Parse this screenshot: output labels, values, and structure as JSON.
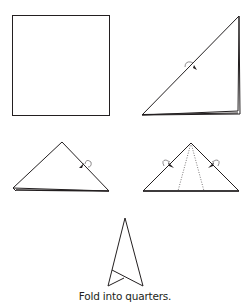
{
  "diagram": {
    "caption": "Fold into quarters.",
    "stroke_color": "#231f20",
    "steps": [
      {
        "id": "step-1",
        "shape": "square"
      },
      {
        "id": "step-2",
        "shape": "folded-triangle",
        "annotation": "fold-arrow"
      },
      {
        "id": "step-3",
        "shape": "triangle",
        "annotation": "fold-arrow"
      },
      {
        "id": "step-4",
        "shape": "triangle-with-dotted-fold-lines",
        "annotation": "two-fold-arrows"
      },
      {
        "id": "step-5",
        "shape": "kite-result"
      }
    ]
  }
}
